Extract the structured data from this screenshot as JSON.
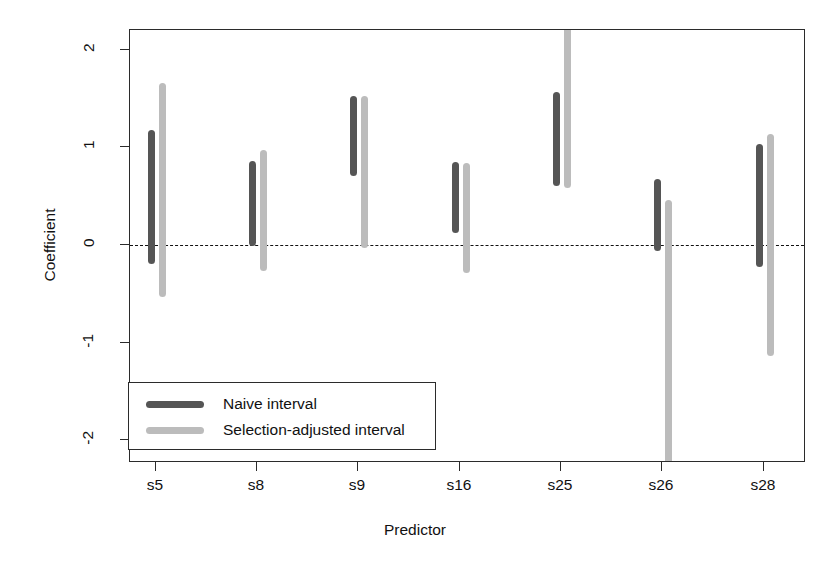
{
  "chart_data": {
    "type": "bar",
    "title": "",
    "xlabel": "Predictor",
    "ylabel": "Coefficient",
    "categories": [
      "s5",
      "s8",
      "s9",
      "s16",
      "s25",
      "s26",
      "s28"
    ],
    "ylim": [
      -2.2,
      2.15
    ],
    "yticks": [
      2,
      1,
      0,
      -1,
      -2
    ],
    "ytick_labels": [
      "2",
      "1",
      "0",
      "-1",
      "-2"
    ],
    "grid": false,
    "reference_line": {
      "value": 0,
      "style": "dashed",
      "color": "#111111"
    },
    "legend": {
      "position": "bottom-left",
      "entries": [
        {
          "name": "Naive interval",
          "color": "#555555"
        },
        {
          "name": "Selection-adjusted interval",
          "color": "#bcbcbc"
        }
      ]
    },
    "series": [
      {
        "name": "Naive interval",
        "color": "#555555",
        "intervals": [
          {
            "category": "s5",
            "low": -0.19,
            "high": 1.18
          },
          {
            "category": "s8",
            "low": -0.01,
            "high": 0.86
          },
          {
            "category": "s9",
            "low": 0.71,
            "high": 1.53
          },
          {
            "category": "s16",
            "low": 0.12,
            "high": 0.85
          },
          {
            "category": "s25",
            "low": 0.6,
            "high": 1.57
          },
          {
            "category": "s26",
            "low": -0.06,
            "high": 0.68
          },
          {
            "category": "s28",
            "low": -0.23,
            "high": 1.03
          }
        ]
      },
      {
        "name": "Selection-adjusted interval",
        "color": "#bcbcbc",
        "intervals": [
          {
            "category": "s5",
            "low": -0.53,
            "high": 1.66
          },
          {
            "category": "s8",
            "low": -0.27,
            "high": 0.97
          },
          {
            "category": "s9",
            "low": -0.03,
            "high": 1.53
          },
          {
            "category": "s16",
            "low": -0.29,
            "high": 0.84
          },
          {
            "category": "s25",
            "low": 0.58,
            "high": 2.15,
            "clipped_high": true
          },
          {
            "category": "s26",
            "low": -2.2,
            "high": 0.46,
            "clipped_low": true
          },
          {
            "category": "s28",
            "low": -1.14,
            "high": 1.14
          }
        ]
      }
    ]
  }
}
